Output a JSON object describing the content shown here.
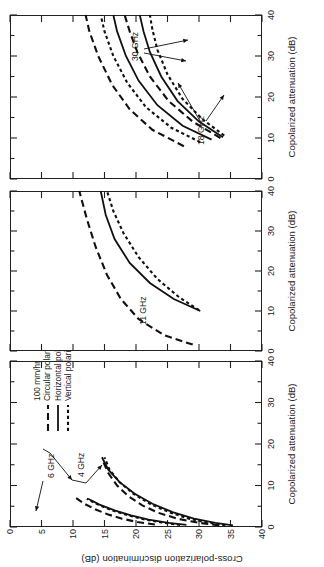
{
  "figure": {
    "y_axis": {
      "label": "Cross-polarization discrimination (dB)",
      "ticks": [
        0,
        5,
        10,
        15,
        20,
        25,
        30,
        35,
        40
      ],
      "min": 0,
      "max": 40,
      "inverted": true
    },
    "x_axis": {
      "label": "Copolarized attenuation (dB)",
      "ticks": [
        0,
        10,
        20,
        30,
        40
      ],
      "minor_step": 5,
      "min": 0,
      "max": 40
    },
    "legend": {
      "title": "100 mm/hr",
      "items": [
        {
          "label": "Circular polarization",
          "style": "dashed-long"
        },
        {
          "label": "Horizontal polarization",
          "style": "solid"
        },
        {
          "label": "Vertical polarization",
          "style": "dashed-short"
        }
      ]
    },
    "panels": [
      {
        "id": "panel-left",
        "annotations": [
          "6 GHz",
          "4 GHz"
        ]
      },
      {
        "id": "panel-middle",
        "annotations": [
          "11 GHz"
        ]
      },
      {
        "id": "panel-right",
        "annotations": [
          "18 GHz",
          "30 GHz"
        ]
      }
    ]
  },
  "chart_data": {
    "type": "line",
    "title": "",
    "xlabel": "Copolarized attenuation (dB)",
    "ylabel": "Cross-polarization discrimination (dB)",
    "xlim": [
      0,
      40
    ],
    "ylim": [
      0,
      40
    ],
    "y_inverted": true,
    "grid": false,
    "legend_position": "inside-left-panel-upper-right",
    "legend_title": "100 mm/hr",
    "legend_entries": [
      "Circular polarization",
      "Horizontal polarization",
      "Vertical polarization"
    ],
    "panels": [
      {
        "name": "4 and 6 GHz",
        "annotations": [
          "6 GHz",
          "4 GHz"
        ],
        "series": [
          {
            "name": "6 GHz circular polarization",
            "frequency_ghz": 6,
            "polarization": "circular",
            "style": "dashed-long",
            "x": [
              0.6,
              1.2,
              2.0,
              3.0,
              4.2,
              5.6,
              7.2
            ],
            "y": [
              23.0,
              20.2,
              17.8,
              15.6,
              13.6,
              11.8,
              10.3
            ]
          },
          {
            "name": "6 GHz horizontal polarization",
            "frequency_ghz": 6,
            "polarization": "horizontal",
            "style": "solid",
            "x": [
              0.5,
              1.0,
              1.8,
              2.8,
              4.0,
              5.4,
              6.8
            ],
            "y": [
              28.0,
              25.2,
              22.0,
              19.2,
              16.6,
              14.2,
              12.4
            ]
          },
          {
            "name": "6 GHz vertical polarization",
            "frequency_ghz": 6,
            "polarization": "vertical",
            "style": "dashed-short",
            "x": [
              0.5,
              1.0,
              1.8,
              2.8,
              4.0,
              5.4,
              6.8
            ],
            "y": [
              27.0,
              24.4,
              21.4,
              18.8,
              16.2,
              14.0,
              12.2
            ]
          },
          {
            "name": "4 GHz circular polarization",
            "frequency_ghz": 4,
            "polarization": "circular",
            "style": "dashed-long",
            "x": [
              0.4,
              1.0,
              2.0,
              3.4,
              5.2,
              7.4,
              10.0,
              13.0,
              16.4
            ],
            "y": [
              33.2,
              30.0,
              26.6,
              23.6,
              21.0,
              18.8,
              17.0,
              15.6,
              14.6
            ]
          },
          {
            "name": "4 GHz horizontal polarization",
            "frequency_ghz": 4,
            "polarization": "horizontal",
            "style": "solid",
            "x": [
              0.4,
              1.0,
              2.0,
              3.6,
              5.6,
              8.0,
              10.8,
              13.8,
              16.8
            ],
            "y": [
              35.4,
              32.6,
              29.2,
              25.8,
              22.6,
              19.8,
              17.4,
              15.6,
              14.6
            ]
          },
          {
            "name": "4 GHz vertical polarization",
            "frequency_ghz": 4,
            "polarization": "vertical",
            "style": "dashed-short",
            "x": [
              0.4,
              1.0,
              2.0,
              3.6,
              5.6,
              8.0,
              10.8,
              13.8,
              16.8
            ],
            "y": [
              34.2,
              31.6,
              28.4,
              25.2,
              22.2,
              19.6,
              17.4,
              15.8,
              15.0
            ]
          }
        ]
      },
      {
        "name": "11 GHz",
        "annotations": [
          "11 GHz"
        ],
        "series": [
          {
            "name": "11 GHz circular polarization",
            "frequency_ghz": 11,
            "polarization": "circular",
            "style": "dashed-long",
            "x": [
              1.6,
              4.0,
              8.0,
              13.0,
              19.0,
              26.0,
              33.0,
              40.0
            ],
            "y": [
              29.0,
              24.4,
              20.4,
              17.6,
              15.4,
              13.6,
              12.2,
              11.0
            ]
          },
          {
            "name": "11 GHz horizontal polarization",
            "frequency_ghz": 11,
            "polarization": "horizontal",
            "style": "solid",
            "x": [
              10.0,
              13.0,
              17.0,
              22.0,
              28.0,
              34.0,
              40.0
            ],
            "y": [
              30.2,
              26.0,
              22.2,
              19.0,
              16.6,
              15.2,
              14.4
            ]
          },
          {
            "name": "11 GHz vertical polarization",
            "frequency_ghz": 11,
            "polarization": "vertical",
            "style": "dashed-short",
            "x": [
              10.2,
              13.5,
              18.0,
              23.5,
              29.5,
              35.0,
              40.0
            ],
            "y": [
              30.0,
              26.8,
              23.4,
              20.4,
              18.0,
              16.4,
              15.4
            ]
          }
        ]
      },
      {
        "name": "18 and 30 GHz",
        "annotations": [
          "18 GHz",
          "30 GHz"
        ],
        "series": [
          {
            "name": "18 GHz circular polarization",
            "frequency_ghz": 18,
            "polarization": "circular",
            "style": "dashed-long",
            "x": [
              8.0,
              12.0,
              17.0,
              23.0,
              30.0,
              36.0,
              40.0
            ],
            "y": [
              27.6,
              22.6,
              19.0,
              16.2,
              14.0,
              12.6,
              12.0
            ]
          },
          {
            "name": "18 GHz horizontal polarization",
            "frequency_ghz": 18,
            "polarization": "horizontal",
            "style": "solid",
            "x": [
              9.6,
              13.0,
              18.0,
              24.0,
              30.0,
              36.0,
              40.0
            ],
            "y": [
              32.0,
              27.4,
              23.4,
              20.4,
              18.4,
              17.0,
              16.4
            ]
          },
          {
            "name": "18 GHz vertical polarization",
            "frequency_ghz": 18,
            "polarization": "vertical",
            "style": "dashed-short",
            "x": [
              9.0,
              12.5,
              17.5,
              23.5,
              30.0,
              36.0,
              40.0
            ],
            "y": [
              30.2,
              25.6,
              21.6,
              18.6,
              16.4,
              15.0,
              14.4
            ]
          },
          {
            "name": "30 GHz circular polarization",
            "frequency_ghz": 30,
            "polarization": "circular",
            "style": "dashed-long",
            "x": [
              10.0,
              14.0,
              19.0,
              25.0,
              31.0,
              36.0,
              40.0
            ],
            "y": [
              33.4,
              29.0,
              25.2,
              22.2,
              20.2,
              19.0,
              18.2
            ]
          },
          {
            "name": "30 GHz horizontal polarization",
            "frequency_ghz": 30,
            "polarization": "horizontal",
            "style": "solid",
            "x": [
              10.2,
              14.0,
              19.0,
              25.0,
              31.0,
              36.0,
              40.0
            ],
            "y": [
              33.8,
              30.0,
              26.6,
              24.0,
              22.2,
              21.2,
              20.6
            ]
          },
          {
            "name": "30 GHz vertical polarization",
            "frequency_ghz": 30,
            "polarization": "vertical",
            "style": "dashed-short",
            "x": [
              10.6,
              14.5,
              19.5,
              25.5,
              31.5,
              36.5,
              40.0
            ],
            "y": [
              34.0,
              30.6,
              27.4,
              25.0,
              23.4,
              22.6,
              22.2
            ]
          }
        ]
      }
    ]
  }
}
